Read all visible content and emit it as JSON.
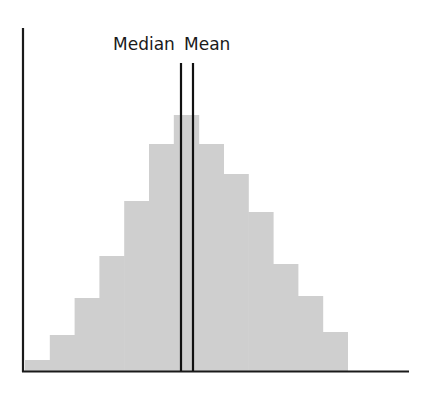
{
  "chart_data": {
    "type": "bar",
    "title": "",
    "xlabel": "",
    "ylabel": "",
    "grid": false,
    "legend": null,
    "categories": [
      1,
      2,
      3,
      4,
      5,
      6,
      7,
      8,
      9,
      10,
      11,
      12,
      13
    ],
    "values": [
      11,
      36,
      73,
      115,
      170,
      227,
      256,
      227,
      197,
      159,
      107,
      75,
      39
    ],
    "annotations": [
      {
        "label": "Median",
        "x_px": 181
      },
      {
        "label": "Mean",
        "x_px": 193
      }
    ]
  },
  "labels": {
    "median": "Median",
    "mean": "Mean"
  },
  "style": {
    "bar_color": "#cfcfcf",
    "axis_color": "#1a1a1a"
  }
}
